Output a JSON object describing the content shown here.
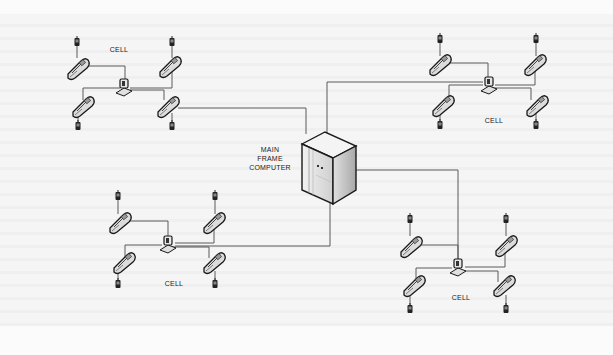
{
  "diagram": {
    "type": "network-topology",
    "center": {
      "label_lines": [
        "MAIN",
        "FRAME",
        "COMPUTER"
      ],
      "icon": "server-tower-icon"
    },
    "cells": [
      {
        "id": "top-left",
        "label": "CELL",
        "hub_icon": "base-station-icon",
        "phones": 4,
        "handsets": 4
      },
      {
        "id": "top-right",
        "label": "CELL",
        "hub_icon": "base-station-icon",
        "phones": 4,
        "handsets": 4
      },
      {
        "id": "bottom-left",
        "label": "CELL",
        "hub_icon": "base-station-icon",
        "phones": 4,
        "handsets": 4
      },
      {
        "id": "bottom-right",
        "label": "CELL",
        "hub_icon": "base-station-icon",
        "phones": 4,
        "handsets": 4
      }
    ],
    "colors": {
      "line": "#555555",
      "icon_outline": "#1a1a1a",
      "icon_fill": "#d8d8d8",
      "server_fill": "#e6e6e6",
      "background": "#f5f5f5"
    }
  }
}
